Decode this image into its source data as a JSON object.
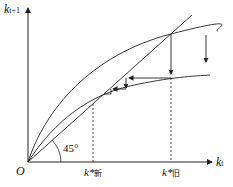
{
  "diagram": {
    "y_axis_label": "k",
    "y_axis_sub": "t+1",
    "x_axis_label": "k",
    "x_axis_sub": "t",
    "origin_label": "O",
    "angle_label": "45°",
    "k_new_label": "k*",
    "k_new_sub": "新",
    "k_old_label": "k*",
    "k_old_sub": "旧",
    "colors": {
      "line": "#222222",
      "background": "#ffffff"
    }
  }
}
